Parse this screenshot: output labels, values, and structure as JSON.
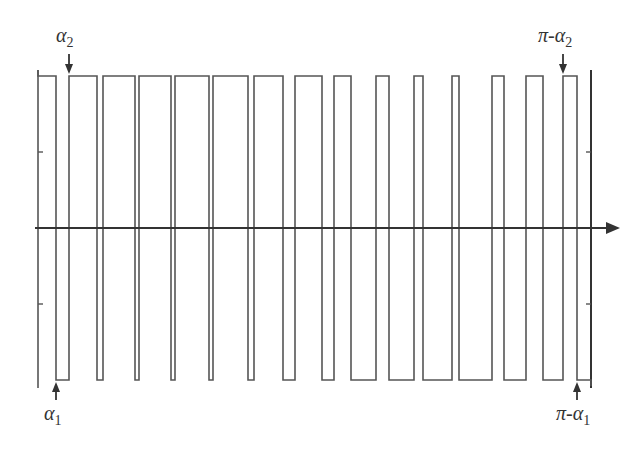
{
  "diagram": {
    "type": "pwm-waveform",
    "colors": {
      "line": "#555555",
      "axis": "#333333",
      "text": "#333333",
      "background": "#ffffff"
    },
    "levels": {
      "high_y": 76,
      "low_y": 380,
      "axis_y": 228
    },
    "axis": {
      "x_start": 35,
      "x_end": 620,
      "arrow_tip_x": 620
    },
    "left_frame": {
      "x": 38,
      "ticks_y": [
        152,
        304
      ]
    },
    "right_frame": {
      "x": 591,
      "ticks_y": [
        152,
        304
      ]
    },
    "high_pulses": [
      [
        38,
        56
      ],
      [
        69,
        97
      ],
      [
        103,
        135
      ],
      [
        139,
        171
      ],
      [
        175,
        209
      ],
      [
        213,
        248
      ],
      [
        254,
        283
      ],
      [
        295,
        322
      ],
      [
        334,
        351
      ],
      [
        376,
        389
      ],
      [
        414,
        423
      ],
      [
        452,
        459
      ],
      [
        492,
        504
      ],
      [
        526,
        543
      ],
      [
        563,
        577
      ]
    ],
    "labels": {
      "alpha2": {
        "main": "α",
        "sub": "2",
        "x": 56,
        "y": 24
      },
      "alpha1": {
        "main": "α",
        "sub": "1",
        "x": 44,
        "y": 402
      },
      "pi_minus_alpha2": {
        "main": "π-α",
        "sub": "2",
        "x": 538,
        "y": 24
      },
      "pi_minus_alpha1": {
        "main": "π-α",
        "sub": "1",
        "x": 556,
        "y": 402
      }
    },
    "arrows": {
      "alpha2": {
        "x": 69,
        "y1": 54,
        "y2": 74,
        "dir": "down"
      },
      "alpha1": {
        "x": 56,
        "y1": 400,
        "y2": 382,
        "dir": "up"
      },
      "pi_minus_alpha2": {
        "x": 563,
        "y1": 54,
        "y2": 74,
        "dir": "down"
      },
      "pi_minus_alpha1": {
        "x": 577,
        "y1": 400,
        "y2": 382,
        "dir": "up"
      }
    }
  }
}
